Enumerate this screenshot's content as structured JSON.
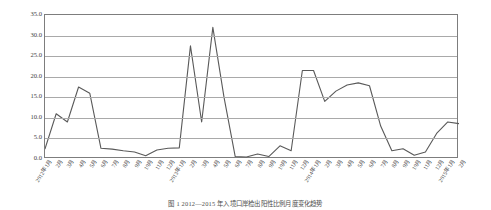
{
  "chart_data": {
    "type": "line",
    "title": "",
    "xlabel": "",
    "ylabel": "EC入境口岸检出阳性比例（%）",
    "ylim": [
      0.0,
      35.0
    ],
    "ytick_labels": [
      "35.0",
      "30.0",
      "25.0",
      "20.0",
      "15.0",
      "10.0",
      "5.0",
      "0.0"
    ],
    "ytick_values": [
      35.0,
      30.0,
      25.0,
      20.0,
      15.0,
      10.0,
      5.0,
      0.0
    ],
    "grid": true,
    "legend": "none",
    "categories": [
      "2012年1月",
      "2月",
      "3月",
      "4月",
      "5月",
      "6月",
      "7月",
      "8月",
      "9月",
      "10月",
      "11月",
      "12月",
      "2013年1月",
      "2月",
      "3月",
      "4月",
      "5月",
      "6月",
      "7月",
      "8月",
      "9月",
      "10月",
      "11月",
      "12月",
      "2014年1月",
      "2月",
      "3月",
      "4月",
      "5月",
      "6月",
      "7月",
      "8月",
      "9月",
      "10月",
      "11月",
      "12月",
      "2015年1月",
      "2月"
    ],
    "values": [
      2.5,
      11.0,
      9.0,
      17.5,
      16.0,
      2.6,
      2.4,
      2.0,
      1.7,
      0.8,
      2.2,
      2.6,
      2.7,
      27.5,
      9.0,
      32.0,
      15.0,
      0.6,
      0.5,
      1.2,
      0.6,
      3.2,
      2.0,
      21.5,
      21.5,
      14.0,
      16.5,
      18.0,
      18.5,
      17.8,
      8.0,
      2.0,
      2.5,
      0.9,
      1.7,
      6.2,
      9.0,
      8.6
    ]
  },
  "caption": {
    "text": "图 1  2012—2015 年入境口岸检出阳性比例月度变化趋势"
  }
}
